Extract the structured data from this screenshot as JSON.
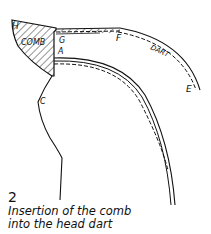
{
  "figure": {
    "number": "2",
    "caption_line1": "Insertion of the comb",
    "caption_line2": "into the head dart"
  },
  "labels": {
    "H": "H",
    "comb": "COMB",
    "G": "G",
    "A": "A",
    "F": "F",
    "dart": "DART",
    "E": "E",
    "C": "C"
  },
  "colors": {
    "ink": "#111111",
    "background": "#ffffff"
  }
}
